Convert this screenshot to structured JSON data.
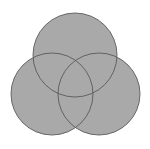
{
  "diagram": {
    "type": "venn",
    "fill": "#a9a9a9",
    "stroke": "#5a5a5a",
    "circles": [
      {
        "name": "top",
        "cx": 75,
        "cy": 55,
        "r": 42
      },
      {
        "name": "left",
        "cx": 52,
        "cy": 94,
        "r": 41
      },
      {
        "name": "right",
        "cx": 99,
        "cy": 94,
        "r": 41
      }
    ]
  }
}
